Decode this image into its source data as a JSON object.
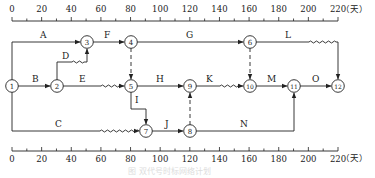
{
  "diagram": {
    "type": "time-scaled network diagram",
    "unit_label": "（天）",
    "axis": {
      "ticks": [
        "0",
        "20",
        "40",
        "60",
        "80",
        "100",
        "120",
        "140",
        "160",
        "180",
        "200",
        "220"
      ],
      "minor_step": 10,
      "range": [
        0,
        220
      ]
    },
    "nodes": [
      {
        "id": "1",
        "day": 0,
        "row": "mid"
      },
      {
        "id": "2",
        "day": 30,
        "row": "mid"
      },
      {
        "id": "3",
        "day": 50,
        "row": "top"
      },
      {
        "id": "4",
        "day": 80,
        "row": "top"
      },
      {
        "id": "5",
        "day": 80,
        "row": "mid"
      },
      {
        "id": "6",
        "day": 160,
        "row": "top"
      },
      {
        "id": "7",
        "day": 90,
        "row": "low"
      },
      {
        "id": "8",
        "day": 120,
        "row": "low"
      },
      {
        "id": "9",
        "day": 120,
        "row": "mid"
      },
      {
        "id": "10",
        "day": 160,
        "row": "mid"
      },
      {
        "id": "11",
        "day": 190,
        "row": "mid"
      },
      {
        "id": "12",
        "day": 220,
        "row": "mid"
      }
    ],
    "activities": [
      {
        "label": "A",
        "from": "1",
        "to": "3"
      },
      {
        "label": "B",
        "from": "1",
        "to": "2"
      },
      {
        "label": "C",
        "from": "1",
        "to": "7",
        "free_float": true
      },
      {
        "label": "D",
        "from": "2",
        "to": "3",
        "free_float": true
      },
      {
        "label": "E",
        "from": "2",
        "to": "5",
        "free_float": true
      },
      {
        "label": "F",
        "from": "3",
        "to": "4"
      },
      {
        "label": "G",
        "from": "4",
        "to": "6"
      },
      {
        "label": "H",
        "from": "5",
        "to": "9"
      },
      {
        "label": "I",
        "from": "5",
        "to": "7"
      },
      {
        "label": "J",
        "from": "7",
        "to": "8"
      },
      {
        "label": "K",
        "from": "9",
        "to": "10",
        "free_float": true
      },
      {
        "label": "L",
        "from": "6",
        "to": "12",
        "free_float": true
      },
      {
        "label": "M",
        "from": "10",
        "to": "11"
      },
      {
        "label": "N",
        "from": "8",
        "to": "11"
      },
      {
        "label": "O",
        "from": "11",
        "to": "12"
      }
    ],
    "dummies": [
      {
        "from": "4",
        "to": "5"
      },
      {
        "from": "6",
        "to": "10"
      },
      {
        "from": "8",
        "to": "9"
      }
    ],
    "caption": "图 双代号时标网络计划"
  }
}
